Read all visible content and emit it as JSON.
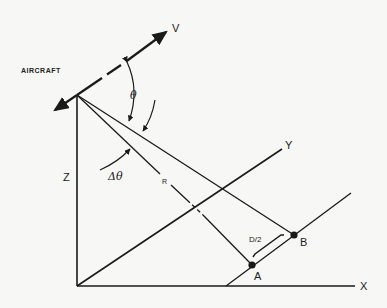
{
  "diagram": {
    "labels": {
      "aircraft": "AIRCRAFT",
      "velocity": "V",
      "theta": "θ",
      "delta_theta": "Δθ",
      "range": "R",
      "z_axis": "Z",
      "y_axis": "Y",
      "x_axis": "X",
      "half_distance": "D/2",
      "point_a": "A",
      "point_b": "B"
    },
    "colors": {
      "ink": "#1a1a1a",
      "paper": "#f7f7f5"
    }
  }
}
